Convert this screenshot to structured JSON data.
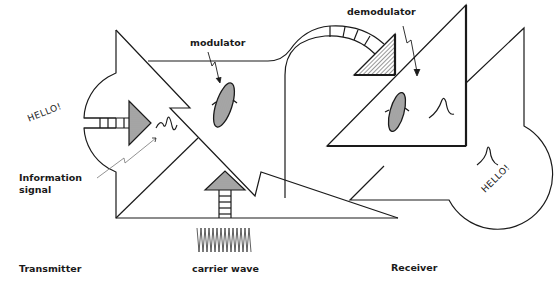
{
  "diagram": {
    "labels": {
      "modulator": "modulator",
      "demodulator": "demodulator",
      "information_signal_line1": "Information",
      "information_signal_line2": "signal",
      "transmitter": "Transmitter",
      "carrier_wave": "carrier wave",
      "receiver": "Receiver"
    },
    "speech": {
      "transmitter_hello": "HELLO!",
      "receiver_hello": "HELLO!"
    },
    "components": [
      {
        "id": "transmitter",
        "label": "Transmitter"
      },
      {
        "id": "modulator",
        "label": "modulator"
      },
      {
        "id": "carrier-wave",
        "label": "carrier wave"
      },
      {
        "id": "demodulator",
        "label": "demodulator"
      },
      {
        "id": "receiver",
        "label": "Receiver"
      }
    ],
    "colors": {
      "stroke": "#1a1a1a",
      "background": "#ffffff"
    }
  }
}
